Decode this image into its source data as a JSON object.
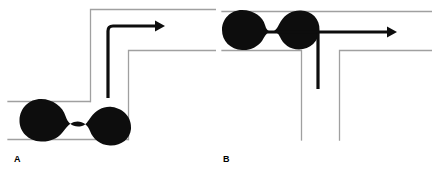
{
  "figure": {
    "title": "",
    "width": 432,
    "height": 173,
    "background_color": "#ffffff",
    "wall_color": "#a0a0a0",
    "droplet_color": "#0d0d0d",
    "arrow_color": "#0d0d0d"
  },
  "panels": [
    {
      "id": "A",
      "label": "A",
      "description": "Dumbbell-shaped droplet in a straight horizontal channel that ends at a step; a rounded right-angle arrow turns upward then to the right.",
      "channel": {
        "type": "step-contraction",
        "inlet_top_wall_y": 101,
        "inlet_bottom_wall_y": 139,
        "inlet_left_x": 8,
        "step_wall_x": 90,
        "step_wall_top_y": 9,
        "second_step_x": 128,
        "second_step_y": 50,
        "outlet_top_wall_y": 9,
        "outlet_bottom_wall_y": 50
      },
      "droplet": {
        "shape": "dumbbell",
        "lobes": 2,
        "neck": "pinched",
        "center_x": 65,
        "center_y": 120,
        "lobe_radius": 21,
        "length": 92
      },
      "arrow": {
        "shape": "elbow-right-angle-rounded",
        "stem_x": 108,
        "stem_bottom_y": 98,
        "corner_y": 26,
        "tip_x": 163,
        "stroke_width": 3.2,
        "direction": "up-then-right"
      }
    },
    {
      "id": "B",
      "label": "B",
      "description": "Compressed dumbbell droplet in a narrow horizontal channel that opens into a T-junction; a T-shaped arrow shows flow splitting downward and to the right.",
      "channel": {
        "type": "t-junction",
        "inlet_top_wall_y": 11,
        "inlet_bottom_wall_y": 50,
        "inlet_left_x": 6,
        "branch_left_wall_x": 85,
        "branch_right_wall_x": 123,
        "branch_bottom_y": 140,
        "outlet_top_wall_y": 11,
        "outlet_bottom_wall_y": 50
      },
      "droplet": {
        "shape": "dumbbell",
        "lobes": 2,
        "neck": "pinched",
        "center_x": 46,
        "center_y": 30,
        "lobe_radius": 20,
        "length": 80
      },
      "arrow": {
        "shape": "tee",
        "horizontal_y": 32,
        "horizontal_left_x": 46,
        "tip_x": 179,
        "stem_x": 102,
        "stem_bottom_y": 89,
        "stroke_width": 3.2,
        "direction": "right-and-down"
      }
    }
  ]
}
